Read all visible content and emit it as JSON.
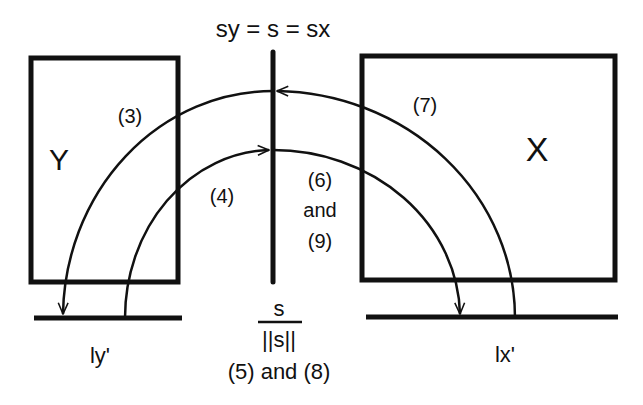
{
  "title": "sy = s = sx",
  "boxes": {
    "left": {
      "label": "Y"
    },
    "right": {
      "label": "X"
    }
  },
  "arcs": {
    "outer_left_label": "(3)",
    "outer_right_label": "(7)",
    "inner_left_label": "(4)",
    "inner_right_label_line1": "(6)",
    "inner_right_label_line2": "and",
    "inner_right_label_line3": "(9)"
  },
  "baselines": {
    "left_label": "ly'",
    "right_label": "lx'"
  },
  "center": {
    "fraction_numerator": "s",
    "fraction_denominator": "||s||",
    "caption": "(5) and (8)"
  },
  "colors": {
    "stroke": "#111111",
    "background": "#ffffff"
  }
}
